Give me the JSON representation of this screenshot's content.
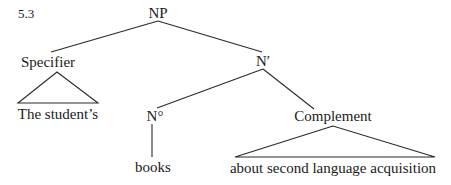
{
  "figure": {
    "number": "5.3",
    "type": "syntax-tree"
  },
  "nodes": {
    "np": {
      "label": "NP"
    },
    "specifier": {
      "label": "Specifier"
    },
    "specifier_leaf": {
      "label": "The student’s"
    },
    "n_bar": {
      "label": "N′"
    },
    "n_zero": {
      "label": "N°"
    },
    "n_zero_leaf": {
      "label": "books"
    },
    "complement": {
      "label": "Complement"
    },
    "complement_leaf": {
      "label": "about second language acquisition"
    }
  },
  "edges": [
    {
      "from": "NP",
      "to": "Specifier",
      "kind": "branch"
    },
    {
      "from": "NP",
      "to": "N′",
      "kind": "branch"
    },
    {
      "from": "Specifier",
      "to": "The student’s",
      "kind": "triangle"
    },
    {
      "from": "N′",
      "to": "N°",
      "kind": "branch"
    },
    {
      "from": "N′",
      "to": "Complement",
      "kind": "branch"
    },
    {
      "from": "N°",
      "to": "books",
      "kind": "branch"
    },
    {
      "from": "Complement",
      "to": "about second language acquisition",
      "kind": "triangle"
    }
  ]
}
